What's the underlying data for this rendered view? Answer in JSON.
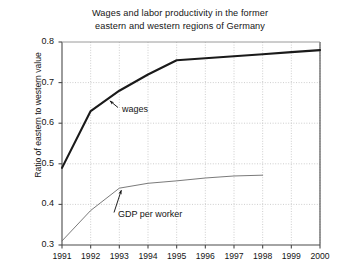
{
  "chart_data": {
    "type": "line",
    "title": "Wages and labor productivity in the former eastern and western regions of Germany",
    "title_line1": "Wages and labor productivity in the former",
    "title_line2": "eastern and western regions of Germany",
    "xlabel": "",
    "ylabel": "Ratio of eastern to western value",
    "xlim": [
      1991,
      2000
    ],
    "ylim": [
      0.3,
      0.8
    ],
    "xticks": [
      1991,
      1992,
      1993,
      1994,
      1995,
      1996,
      1997,
      1998,
      1999,
      2000
    ],
    "xtick_labels": [
      "1991",
      "1992",
      "1993",
      "1994",
      "1995",
      "1996",
      "1997",
      "1998",
      "1999",
      "2000"
    ],
    "yticks": [
      0.3,
      0.4,
      0.5,
      0.6,
      0.7,
      0.8
    ],
    "ytick_labels": [
      "0.3",
      "0.4",
      "0.5",
      "0.6",
      "0.7",
      "0.8"
    ],
    "grid": true,
    "grid_style": "dotted",
    "legend": "none",
    "annotations": [
      {
        "text": "wages",
        "series": "wages",
        "points_to_year": 1992.6
      },
      {
        "text": "GDP per worker",
        "series": "gdp_per_worker",
        "points_to_year": 1993.0
      }
    ],
    "series": [
      {
        "name": "wages",
        "label": "wages",
        "color": "#1a1a1a",
        "width": 2.1,
        "x": [
          1991,
          1992,
          1993,
          1994,
          1995,
          1996,
          1997,
          1998,
          1999,
          2000
        ],
        "values": [
          0.49,
          0.63,
          0.68,
          0.72,
          0.755,
          0.76,
          0.765,
          0.77,
          0.775,
          0.78
        ]
      },
      {
        "name": "gdp_per_worker",
        "label": "GDP per worker",
        "color": "#6b6b6b",
        "width": 0.9,
        "x": [
          1991,
          1992,
          1993,
          1994,
          1995,
          1996,
          1997,
          1998
        ],
        "values": [
          0.31,
          0.385,
          0.44,
          0.452,
          0.458,
          0.465,
          0.47,
          0.472
        ]
      }
    ]
  },
  "colors": {
    "axis": "#4a4a4a",
    "grid": "#b9b9b9",
    "background": "#ffffff",
    "text": "#151515"
  }
}
